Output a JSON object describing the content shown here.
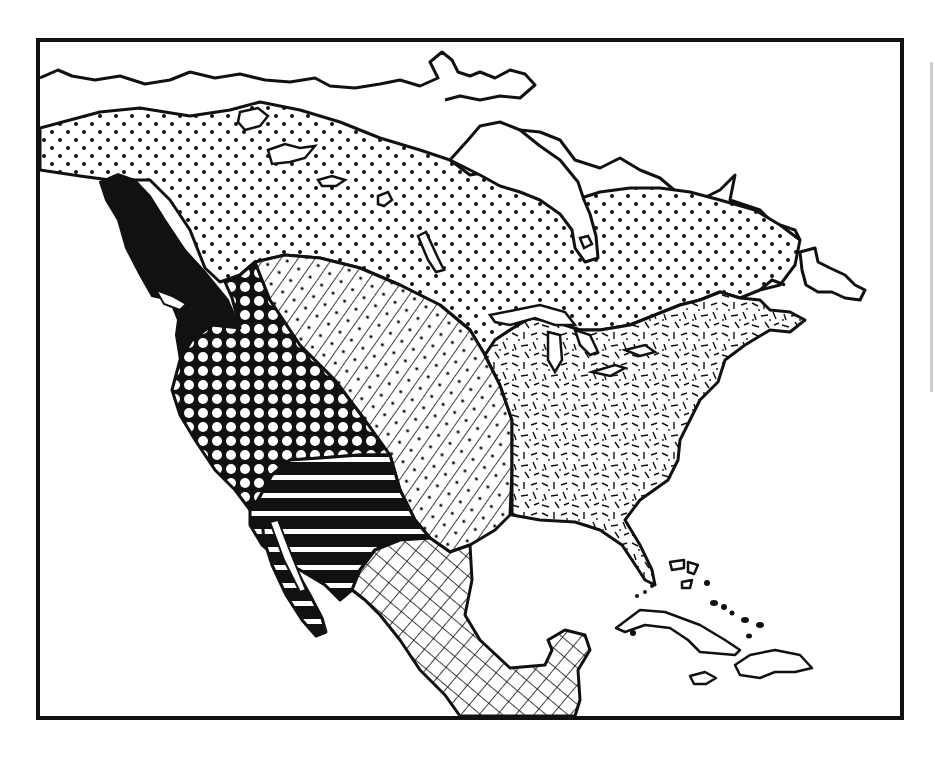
{
  "map": {
    "subject": "North America",
    "style": "black-and-white patterned region map",
    "colors": {
      "ink": "#111111",
      "paper": "#ffffff"
    },
    "regions": [
      {
        "id": "arctic",
        "pattern": "dots",
        "area": "Arctic / Subarctic band across northern Canada and Alaska"
      },
      {
        "id": "northwest-coast",
        "pattern": "solid-black",
        "area": "Pacific Northwest coast"
      },
      {
        "id": "plateau-california",
        "pattern": "circles",
        "area": "Plateau / Great Basin / California"
      },
      {
        "id": "plains",
        "pattern": "diagonal-lines-with-dots",
        "area": "Great Plains"
      },
      {
        "id": "eastern-woodlands",
        "pattern": "random-dashes",
        "area": "Eastern Woodlands"
      },
      {
        "id": "southwest",
        "pattern": "horizontal-stripes",
        "area": "Southwest"
      },
      {
        "id": "mesoamerica",
        "pattern": "crosshatch",
        "area": "Mexico / Mesoamerica"
      }
    ],
    "labels": []
  }
}
